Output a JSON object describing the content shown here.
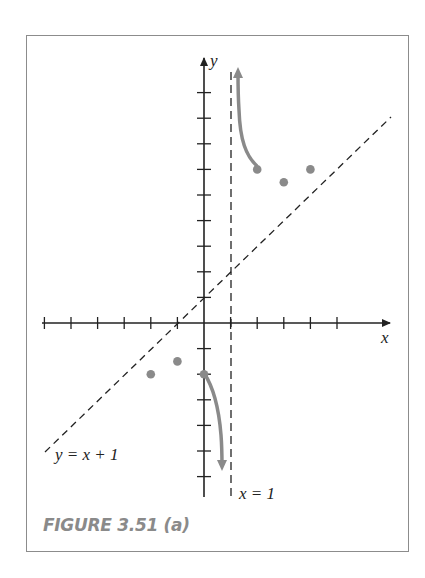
{
  "caption": "FIGURE 3.51 (a)",
  "labels": {
    "x_axis": "x",
    "y_axis": "y",
    "oblique_asymptote": "y = x + 1",
    "vertical_asymptote": "x = 1"
  },
  "colors": {
    "curve": "#8a8a8a",
    "axes": "#222222",
    "frame": "#8c8c8c",
    "caption": "#8a8a8a"
  },
  "chart_data": {
    "type": "scatter",
    "title": "FIGURE 3.51 (a)",
    "function": "y = x + 1 + 3/(x - 1)",
    "xlabel": "x",
    "ylabel": "y",
    "xlim": [
      -7,
      7
    ],
    "ylim": [
      -7,
      9
    ],
    "grid": false,
    "tick_step": 1,
    "x_ticks": [
      -6,
      -5,
      -4,
      -3,
      -2,
      -1,
      1,
      2,
      3,
      4,
      5
    ],
    "y_ticks": [
      -6,
      -5,
      -4,
      -3,
      -2,
      -1,
      1,
      2,
      3,
      4,
      5,
      6,
      7,
      8,
      9
    ],
    "points": [
      {
        "x": -2,
        "y": -2
      },
      {
        "x": -1,
        "y": -1.5
      },
      {
        "x": 0,
        "y": -2
      },
      {
        "x": 2,
        "y": 6
      },
      {
        "x": 3,
        "y": 5.5
      },
      {
        "x": 4,
        "y": 6
      }
    ],
    "curve_segments": [
      {
        "from": {
          "x": 0,
          "y": -2
        },
        "to": {
          "x": 0.8,
          "y": -13
        },
        "direction": "down toward asymptote x=1"
      },
      {
        "from": {
          "x": 2,
          "y": 6
        },
        "to": {
          "x": 1.3,
          "y": 12.3
        },
        "direction": "up toward asymptote x=1"
      }
    ],
    "asymptotes": [
      {
        "type": "oblique",
        "equation": "y = x + 1",
        "style": "dashed"
      },
      {
        "type": "vertical",
        "equation": "x = 1",
        "style": "dashed"
      }
    ],
    "annotations": [
      "y = x + 1",
      "x = 1"
    ]
  }
}
